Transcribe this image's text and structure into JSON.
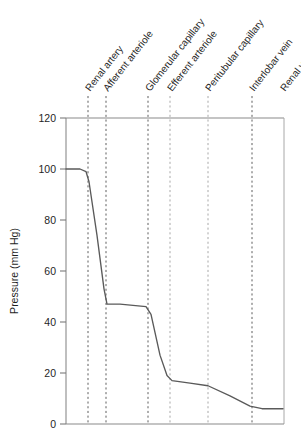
{
  "chart_data": {
    "type": "line",
    "title": "",
    "subtitle": "",
    "xlabel": "",
    "ylabel": "Pressure (mm Hg)",
    "ylim": [
      0,
      120
    ],
    "yticks": [
      0,
      20,
      40,
      60,
      80,
      100,
      120
    ],
    "ytick_labels": [
      "0",
      "20",
      "40",
      "60",
      "80",
      "100",
      "120"
    ],
    "grid": "vertical-dashed-at-categories",
    "legend": "none",
    "categories": [
      "Renal artery",
      "Afferent arteriole",
      "Glomerular capillary",
      "Efferent arteriole",
      "Peritubular capillary",
      "Interlobar vein",
      "Renal vein"
    ],
    "category_x_positions": [
      88,
      106,
      148,
      170,
      208,
      252,
      283
    ],
    "series": [
      {
        "name": "Pressure along renal vasculature",
        "values_at_categories": [
          100,
          47,
          47,
          18,
          15,
          7,
          6
        ],
        "points": [
          {
            "x": 66,
            "pressure": 100
          },
          {
            "x": 80,
            "pressure": 100
          },
          {
            "x": 86,
            "pressure": 99
          },
          {
            "x": 89,
            "pressure": 95
          },
          {
            "x": 97,
            "pressure": 74
          },
          {
            "x": 104,
            "pressure": 53
          },
          {
            "x": 107,
            "pressure": 47
          },
          {
            "x": 120,
            "pressure": 47
          },
          {
            "x": 146,
            "pressure": 46
          },
          {
            "x": 151,
            "pressure": 43
          },
          {
            "x": 160,
            "pressure": 27
          },
          {
            "x": 167,
            "pressure": 19
          },
          {
            "x": 172,
            "pressure": 17
          },
          {
            "x": 190,
            "pressure": 16
          },
          {
            "x": 208,
            "pressure": 15
          },
          {
            "x": 230,
            "pressure": 11
          },
          {
            "x": 250,
            "pressure": 7
          },
          {
            "x": 262,
            "pressure": 6
          },
          {
            "x": 283,
            "pressure": 6
          }
        ]
      }
    ]
  },
  "axes": {
    "y_axis_title": "Pressure (mm Hg)",
    "y_tick_values": [
      "120",
      "100",
      "80",
      "60",
      "40",
      "20",
      "0"
    ]
  },
  "category_labels": {
    "renal_artery": "Renal artery",
    "afferent_arteriole": "Afferent arteriole",
    "glomerular_capillary": "Glomerular capillary",
    "efferent_arteriole": "Efferent arteriole",
    "peritubular_capillary": "Peritubular capillary",
    "interlobar_vein": "Interlobar vein",
    "renal_vein": "Renal vein"
  },
  "colors": {
    "curve": "#5a5a5a",
    "axis": "#8a8a8a",
    "grid": "#4d4d4d",
    "text": "#1f1f1f",
    "background": "#ffffff"
  }
}
